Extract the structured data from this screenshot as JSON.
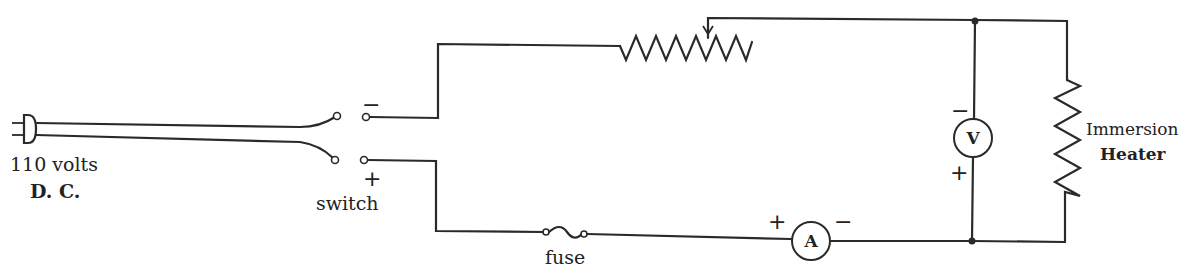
{
  "diagram": {
    "type": "circuit-schematic",
    "source": {
      "label_line1": "110 volts",
      "label_line2": "D. C.",
      "icon": "plug-icon"
    },
    "switch": {
      "label": "switch",
      "top_terminal_sign": "−",
      "bottom_terminal_sign": "+"
    },
    "rheostat": {
      "icon": "variable-resistor-icon"
    },
    "fuse": {
      "label": "fuse"
    },
    "ammeter": {
      "letter": "A",
      "plus_sign": "+",
      "minus_sign": "−"
    },
    "voltmeter": {
      "letter": "V",
      "minus_sign": "−",
      "plus_sign": "+"
    },
    "heater": {
      "label_line1": "Immersion",
      "label_line2": "Heater"
    },
    "colors": {
      "line": "#2a2a2a",
      "background": "#ffffff"
    }
  }
}
